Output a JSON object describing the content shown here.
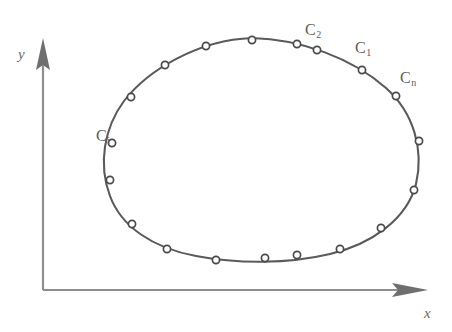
{
  "figure": {
    "background_color": "#ffffff",
    "curve_color": "#5a5a5a",
    "axis_color": "#8e8e8e",
    "label_color": "#5d5d5d",
    "marker_fill": "#ffffff",
    "marker_stroke": "#4a4a4a"
  },
  "axes": {
    "y_label": "y",
    "x_label": "x",
    "origin": {
      "x": 43,
      "y": 290
    },
    "x_end": {
      "x": 424,
      "y": 290
    },
    "y_end": {
      "x": 43,
      "y": 44
    }
  },
  "point_labels": [
    {
      "name": "C-i",
      "letter": "C",
      "subscript": "i",
      "x": 96,
      "y": 128,
      "marker_index": 12
    },
    {
      "name": "C-2",
      "letter": "C",
      "subscript": "2",
      "x": 305,
      "y": 22,
      "marker_index": 5
    },
    {
      "name": "C-1",
      "letter": "C",
      "subscript": "1",
      "x": 355,
      "y": 40,
      "marker_index": 6
    },
    {
      "name": "C-n",
      "letter": "C",
      "subscript": "n",
      "x": 400,
      "y": 70,
      "marker_index": 7
    }
  ],
  "chart_data": {
    "type": "scatter",
    "title": "",
    "xlabel": "x",
    "ylabel": "y",
    "grid": false,
    "legend": "none",
    "curve_closed": true,
    "marker_count": 18,
    "markers": [
      {
        "x": 252,
        "y": 40
      },
      {
        "x": 206,
        "y": 46
      },
      {
        "x": 165,
        "y": 65
      },
      {
        "x": 131,
        "y": 97
      },
      {
        "x": 297,
        "y": 44
      },
      {
        "x": 317,
        "y": 50
      },
      {
        "x": 362,
        "y": 70
      },
      {
        "x": 396,
        "y": 96
      },
      {
        "x": 419,
        "y": 141
      },
      {
        "x": 414,
        "y": 190
      },
      {
        "x": 381,
        "y": 228
      },
      {
        "x": 340,
        "y": 249
      },
      {
        "x": 112,
        "y": 143
      },
      {
        "x": 110,
        "y": 180
      },
      {
        "x": 132,
        "y": 224
      },
      {
        "x": 167,
        "y": 249
      },
      {
        "x": 216,
        "y": 260
      },
      {
        "x": 265,
        "y": 258
      },
      {
        "x": 297,
        "y": 255
      }
    ],
    "curve_path": "M 252 38 C 300 39 352 58 386 88 C 414 113 424 150 416 184 C 407 219 372 244 330 254 C 288 264 238 264 196 256 C 152 248 121 226 110 196 C 98 164 104 128 124 101 C 148 70 198 40 252 38 Z"
  }
}
